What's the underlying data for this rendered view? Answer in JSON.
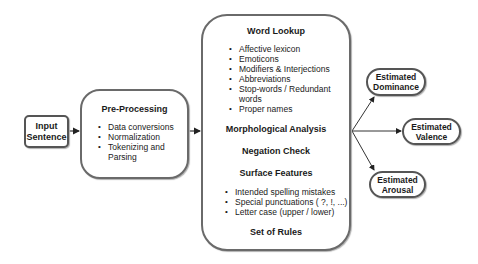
{
  "input": {
    "label_line1": "Input",
    "label_line2": "Sentence"
  },
  "preprocessing": {
    "title": "Pre-Processing",
    "items": [
      "Data conversions",
      "Normalization",
      "Tokenizing and Parsing"
    ]
  },
  "main": {
    "word_lookup": {
      "title": "Word Lookup",
      "items": [
        "Affective lexicon",
        "Emoticons",
        "Modifiers & Interjections",
        "Abbreviations",
        "Stop-words / Redundant words",
        "Proper names"
      ]
    },
    "morphological_analysis": "Morphological Analysis",
    "negation_check": "Negation Check",
    "surface_features": {
      "title": "Surface Features",
      "items": [
        "Intended spelling mistakes",
        "Special punctuations ( ?, !, ...)",
        "Letter case (upper / lower)"
      ]
    },
    "set_of_rules": "Set of Rules"
  },
  "outputs": {
    "dominance": {
      "line1": "Estimated",
      "line2": "Dominance"
    },
    "valence": {
      "line1": "Estimated",
      "line2": "Valence"
    },
    "arousal": {
      "line1": "Estimated",
      "line2": "Arousal"
    }
  }
}
